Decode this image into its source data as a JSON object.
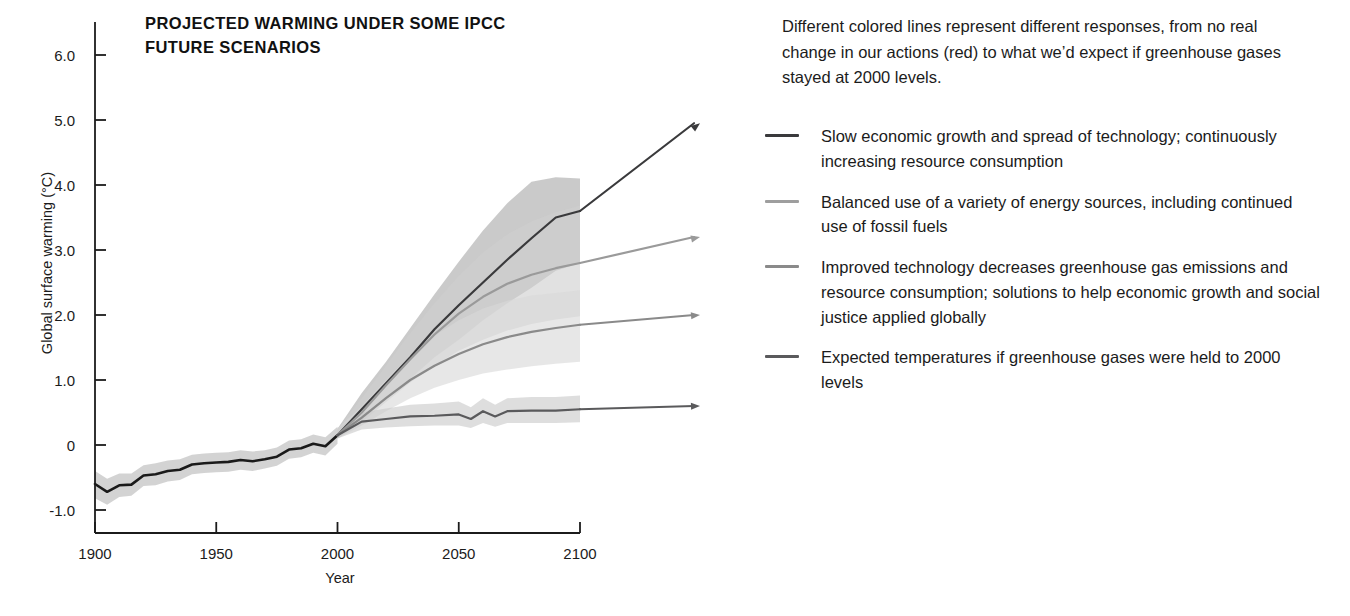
{
  "chart_data": {
    "type": "line",
    "title": "PROJECTED WARMING UNDER SOME IPCC FUTURE SCENARIOS",
    "title_line1": "PROJECTED WARMING UNDER SOME IPCC",
    "title_line2": "FUTURE SCENARIOS",
    "xlabel": "Year",
    "ylabel": "Global surface warming (°C)",
    "xlim": [
      1900,
      2100
    ],
    "ylim": [
      -1.0,
      6.5
    ],
    "xticks": [
      "1900",
      "1950",
      "2000",
      "2050",
      "2100"
    ],
    "xtick_values": [
      1900,
      1950,
      2000,
      2050,
      2100
    ],
    "yticks": [
      "6.0",
      "5.0",
      "4.0",
      "3.0",
      "2.0",
      "1.0",
      "0",
      "-1.0"
    ],
    "ytick_values": [
      6.0,
      5.0,
      4.0,
      3.0,
      2.0,
      1.0,
      0,
      -1.0
    ],
    "grid": false,
    "legend_position": "right",
    "series": [
      {
        "name": "historical",
        "label": "Observed historical global surface warming",
        "color": "#1a1a1a",
        "band_color": "#b8b8b8",
        "x": [
          1900,
          1905,
          1910,
          1915,
          1920,
          1925,
          1930,
          1935,
          1940,
          1945,
          1950,
          1955,
          1960,
          1965,
          1970,
          1975,
          1980,
          1985,
          1990,
          1995,
          2000
        ],
        "values": [
          -0.6,
          -0.72,
          -0.62,
          -0.61,
          -0.47,
          -0.45,
          -0.4,
          -0.38,
          -0.3,
          -0.28,
          -0.27,
          -0.26,
          -0.23,
          -0.25,
          -0.22,
          -0.18,
          -0.07,
          -0.05,
          0.02,
          -0.02,
          0.15
        ],
        "band_low": [
          -0.82,
          -0.92,
          -0.8,
          -0.78,
          -0.63,
          -0.62,
          -0.56,
          -0.54,
          -0.45,
          -0.43,
          -0.42,
          -0.41,
          -0.38,
          -0.4,
          -0.36,
          -0.32,
          -0.21,
          -0.19,
          -0.12,
          -0.16,
          0.02
        ],
        "band_high": [
          -0.4,
          -0.52,
          -0.44,
          -0.44,
          -0.31,
          -0.28,
          -0.24,
          -0.22,
          -0.15,
          -0.13,
          -0.12,
          -0.11,
          -0.08,
          -0.1,
          -0.08,
          -0.04,
          0.07,
          0.09,
          0.16,
          0.12,
          0.28
        ]
      },
      {
        "name": "a2",
        "label": "Slow economic growth and spread of technology; continuously increasing resource consumption",
        "color": "#3a3a3c",
        "band_color": "#a9a9a9",
        "x": [
          2000,
          2010,
          2020,
          2030,
          2040,
          2050,
          2060,
          2070,
          2080,
          2090,
          2100
        ],
        "values": [
          0.15,
          0.55,
          0.95,
          1.35,
          1.78,
          2.15,
          2.5,
          2.85,
          3.18,
          3.5,
          3.6
        ],
        "band_low": [
          0.1,
          0.38,
          0.7,
          1.02,
          1.35,
          1.62,
          1.92,
          2.18,
          2.42,
          2.68,
          2.8
        ],
        "band_high": [
          0.25,
          0.8,
          1.28,
          1.8,
          2.32,
          2.82,
          3.3,
          3.72,
          4.05,
          4.12,
          4.1
        ],
        "arrow_end_value": 4.95
      },
      {
        "name": "a1b",
        "label": "Balanced use of a variety of energy sources, including continued use of fossil fuels",
        "color": "#9a9a9a",
        "band_color": "#cfcfcf",
        "x": [
          2000,
          2010,
          2020,
          2030,
          2040,
          2050,
          2060,
          2070,
          2080,
          2090,
          2100
        ],
        "values": [
          0.15,
          0.5,
          0.92,
          1.32,
          1.7,
          2.02,
          2.28,
          2.48,
          2.62,
          2.72,
          2.8
        ],
        "band_low": [
          0.1,
          0.35,
          0.66,
          0.96,
          1.22,
          1.45,
          1.62,
          1.76,
          1.86,
          1.93,
          1.98
        ],
        "band_high": [
          0.25,
          0.72,
          1.22,
          1.72,
          2.18,
          2.6,
          2.96,
          3.24,
          3.44,
          3.58,
          3.68
        ],
        "arrow_end_value": 3.2
      },
      {
        "name": "b1",
        "label": "Improved technology decreases greenhouse gas emissions and resource consumption; solutions to help economic growth and social justice applied globally",
        "color": "#8a8a8a",
        "band_color": "#d8d8d8",
        "x": [
          2000,
          2010,
          2020,
          2030,
          2040,
          2050,
          2060,
          2070,
          2080,
          2090,
          2100
        ],
        "values": [
          0.15,
          0.42,
          0.72,
          1.0,
          1.22,
          1.4,
          1.55,
          1.66,
          1.74,
          1.8,
          1.85
        ],
        "band_low": [
          0.1,
          0.3,
          0.52,
          0.72,
          0.88,
          1.0,
          1.1,
          1.16,
          1.21,
          1.25,
          1.28
        ],
        "band_high": [
          0.25,
          0.6,
          1.0,
          1.38,
          1.68,
          1.92,
          2.1,
          2.22,
          2.3,
          2.34,
          2.38
        ],
        "arrow_end_value": 2.0
      },
      {
        "name": "constant2000",
        "label": "Expected temperatures if greenhouse gases were held to 2000 levels",
        "color": "#5a5a5c",
        "band_color": "#cacaca",
        "x": [
          2000,
          2010,
          2020,
          2030,
          2040,
          2050,
          2055,
          2060,
          2065,
          2070,
          2080,
          2090,
          2100
        ],
        "values": [
          0.15,
          0.36,
          0.4,
          0.44,
          0.45,
          0.47,
          0.4,
          0.52,
          0.44,
          0.52,
          0.53,
          0.53,
          0.55
        ],
        "band_low": [
          0.1,
          0.24,
          0.27,
          0.29,
          0.3,
          0.3,
          0.26,
          0.34,
          0.28,
          0.34,
          0.34,
          0.34,
          0.35
        ],
        "band_high": [
          0.25,
          0.5,
          0.56,
          0.62,
          0.64,
          0.67,
          0.58,
          0.72,
          0.62,
          0.72,
          0.74,
          0.74,
          0.76
        ],
        "arrow_end_value": 0.6
      }
    ]
  },
  "blurb": "Different colored lines represent different responses, from no real change in our actions (red) to what we’d expect if greenhouse gases stayed at 2000 levels.",
  "legend": {
    "items": [
      {
        "color": "#3a3a3c",
        "label": "Slow economic growth and spread of technology; continuously increasing resource consumption"
      },
      {
        "color": "#9e9e9e",
        "label": "Balanced use of a variety of energy sources, including continued use of fossil fuels"
      },
      {
        "color": "#8a8a8a",
        "label": "Improved technology decreases greenhouse gas emissions and resource consumption; solutions to help economic growth and social justice applied globally"
      },
      {
        "color": "#5a5a5c",
        "label": "Expected temperatures if greenhouse gases were held to 2000 levels"
      }
    ]
  }
}
